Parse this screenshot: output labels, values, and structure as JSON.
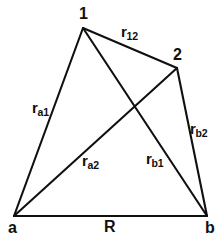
{
  "figure": {
    "background_color": "#ffffff",
    "line_color": "#101010",
    "text_color": "#101010",
    "width": 222,
    "height": 242
  },
  "vertices": [
    {
      "id": "one",
      "label": "1",
      "x": 83,
      "y": 28,
      "label_x": 79,
      "label_y": 6
    },
    {
      "id": "two",
      "label": "2",
      "x": 177,
      "y": 68,
      "label_x": 173,
      "label_y": 47
    },
    {
      "id": "a",
      "label": "a",
      "x": 14,
      "y": 216,
      "label_x": 8,
      "label_y": 220
    },
    {
      "id": "b",
      "label": "b",
      "x": 207,
      "y": 216,
      "label_x": 205,
      "label_y": 220
    }
  ],
  "edges": [
    {
      "id": "r_a1",
      "from": "a",
      "to": "one",
      "base": "r",
      "sub": "a1",
      "x1": 14,
      "y1": 216,
      "x2": 83,
      "y2": 28,
      "label_x": 32,
      "label_y": 100
    },
    {
      "id": "r_12",
      "from": "one",
      "to": "two",
      "base": "r",
      "sub": "12",
      "x1": 83,
      "y1": 28,
      "x2": 177,
      "y2": 68,
      "label_x": 121,
      "label_y": 24
    },
    {
      "id": "r_b2",
      "from": "two",
      "to": "b",
      "base": "r",
      "sub": "b2",
      "x1": 177,
      "y1": 68,
      "x2": 207,
      "y2": 216,
      "label_x": 190,
      "label_y": 121
    },
    {
      "id": "r_a2",
      "from": "a",
      "to": "two",
      "base": "r",
      "sub": "a2",
      "x1": 14,
      "y1": 216,
      "x2": 177,
      "y2": 68,
      "label_x": 82,
      "label_y": 153
    },
    {
      "id": "r_b1",
      "from": "one",
      "to": "b",
      "base": "r",
      "sub": "b1",
      "x1": 83,
      "y1": 28,
      "x2": 207,
      "y2": 216,
      "label_x": 146,
      "label_y": 151
    },
    {
      "id": "R",
      "from": "a",
      "to": "b",
      "base": "R",
      "sub": "",
      "x1": 14,
      "y1": 216,
      "x2": 207,
      "y2": 216,
      "label_x": 104,
      "label_y": 219
    }
  ],
  "crossing_point": {
    "x": 131,
    "y": 114
  }
}
